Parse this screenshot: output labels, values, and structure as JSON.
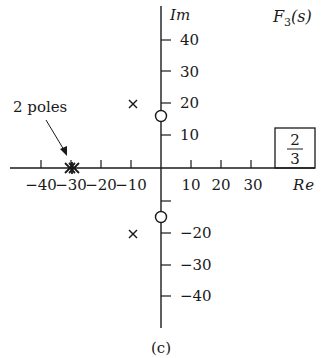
{
  "figure": {
    "caption": "(c)",
    "function_label_main": "F",
    "function_label_sub": "3",
    "function_label_arg": "(s)",
    "gain_box": {
      "numerator": "2",
      "denominator": "3"
    },
    "annotation": "2 poles"
  },
  "axes": {
    "x_label": "Re",
    "y_label": "Im",
    "x_ticks": [
      {
        "value": -40,
        "label": "−40"
      },
      {
        "value": -30,
        "label": "−30"
      },
      {
        "value": -20,
        "label": "−20"
      },
      {
        "value": -10,
        "label": "−10"
      },
      {
        "value": 10,
        "label": "10"
      },
      {
        "value": 20,
        "label": "20"
      },
      {
        "value": 30,
        "label": "30"
      }
    ],
    "y_ticks": [
      {
        "value": 40,
        "label": "40"
      },
      {
        "value": 30,
        "label": "30"
      },
      {
        "value": 20,
        "label": "20"
      },
      {
        "value": 10,
        "label": "10"
      },
      {
        "value": -10,
        "label": ""
      },
      {
        "value": -20,
        "label": "−20"
      },
      {
        "value": -30,
        "label": "−30"
      },
      {
        "value": -40,
        "label": "−40"
      }
    ],
    "x_range": [
      -50,
      50
    ],
    "y_range": [
      -50,
      50
    ]
  },
  "pole_zero": {
    "poles": [
      {
        "re": -10,
        "im": 20,
        "marker": "x"
      },
      {
        "re": -10,
        "im": -20,
        "marker": "x"
      },
      {
        "re": -30,
        "im": 0,
        "marker": "x",
        "multiplicity": 2
      }
    ],
    "zeros": [
      {
        "re": 0,
        "im": 15,
        "marker": "o"
      },
      {
        "re": 0,
        "im": -15,
        "marker": "o"
      }
    ],
    "gain": "2/3"
  }
}
